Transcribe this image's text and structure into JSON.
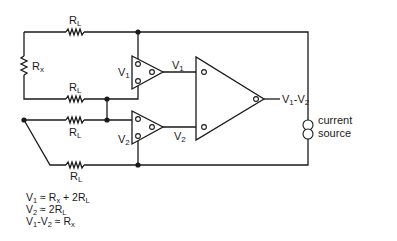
{
  "diagram": {
    "title": "",
    "type": "circuit-schematic",
    "components": {
      "rl_top": {
        "label": "R",
        "sub": "L"
      },
      "rx": {
        "label": "R",
        "sub": "x"
      },
      "rl_second": {
        "label": "R",
        "sub": "L"
      },
      "rl_third": {
        "label": "R",
        "sub": "L"
      },
      "rl_bottom": {
        "label": "R",
        "sub": "L"
      },
      "amp1": {
        "label": "V",
        "sub": "1"
      },
      "amp1_out": {
        "label": "V",
        "sub": "1"
      },
      "amp2": {
        "label": "V",
        "sub": "2"
      },
      "amp2_out": {
        "label": "V",
        "sub": "2"
      },
      "diff_out": {
        "a": "V",
        "a_sub": "1",
        "sep": "-",
        "b": "V",
        "b_sub": "2"
      },
      "current_source": {
        "line1": "current",
        "line2": "source"
      }
    },
    "equations": [
      {
        "lhs": "V",
        "lhs_sub": "1",
        "op": " ≈ ",
        "t1": "R",
        "t1_sub": "x",
        "plus": " + 2",
        "t2": "R",
        "t2_sub": "L"
      },
      {
        "lhs": "V",
        "lhs_sub": "2",
        "op": " ≈ 2",
        "t1": "R",
        "t1_sub": "L"
      },
      {
        "lhs": "V",
        "lhs_sub": "1",
        "minus": "-",
        "lhs2": "V",
        "lhs2_sub": "2",
        "op": " ≈ ",
        "t1": "R",
        "t1_sub": "x"
      }
    ]
  }
}
